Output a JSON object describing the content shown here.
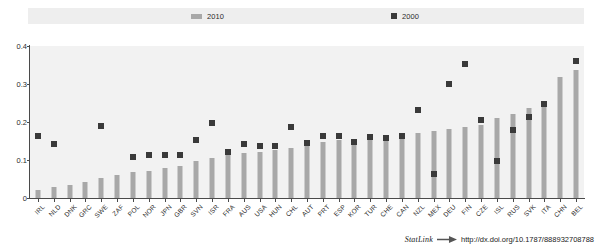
{
  "legend": {
    "items": [
      {
        "label": "2010",
        "type": "bar",
        "color": "#a8a8a8"
      },
      {
        "label": "2000",
        "type": "marker",
        "color": "#3a3a3a"
      }
    ]
  },
  "footer": {
    "statlink_label": "StatLink",
    "statlink_icon": "arrow-glyph-icon",
    "url": "http://dx.doi.org/10.1787/888932708788"
  },
  "chart_data": {
    "type": "bar",
    "title": "",
    "subtitle": "",
    "xlabel": "",
    "ylabel": "",
    "ylim": [
      0,
      0.4
    ],
    "yticks": [
      0,
      0.1,
      0.2,
      0.3,
      0.4
    ],
    "ytick_labels": [
      "0",
      "0.1",
      "0.2",
      "0.3",
      "0.4"
    ],
    "grid": false,
    "legend_position": "top",
    "categories": [
      "IRL",
      "NLD",
      "DNK",
      "GRC",
      "SWE",
      "ZAF",
      "POL",
      "NOR",
      "JPN",
      "GBR",
      "SVN",
      "ISR",
      "FRA",
      "AUS",
      "USA",
      "HUN",
      "CHL",
      "AUT",
      "PRT",
      "ESP",
      "KOR",
      "TUR",
      "CHE",
      "CAN",
      "NZL",
      "MEX",
      "DEU",
      "FIN",
      "CZE",
      "ISL",
      "RUS",
      "SVK",
      "ITA",
      "CHN",
      "BEL"
    ],
    "series": [
      {
        "name": "2010",
        "type": "bar",
        "color": "#a8a8a8",
        "values": [
          0.022,
          0.028,
          0.033,
          0.043,
          0.052,
          0.06,
          0.068,
          0.072,
          0.078,
          0.085,
          0.098,
          0.104,
          0.112,
          0.118,
          0.122,
          0.126,
          0.132,
          0.14,
          0.148,
          0.152,
          0.155,
          0.158,
          0.162,
          0.168,
          0.172,
          0.176,
          0.182,
          0.188,
          0.192,
          0.21,
          0.222,
          0.238,
          0.252,
          0.318,
          0.338
        ]
      },
      {
        "name": "2000",
        "type": "marker",
        "color": "#3a3a3a",
        "values": [
          0.162,
          0.142,
          null,
          null,
          0.19,
          null,
          0.108,
          0.112,
          0.112,
          0.113,
          0.152,
          0.198,
          0.12,
          0.142,
          0.138,
          0.136,
          0.188,
          0.145,
          0.162,
          0.163,
          0.147,
          0.16,
          0.158,
          0.162,
          0.232,
          0.062,
          0.3,
          0.352,
          0.205,
          0.098,
          0.178,
          0.212,
          0.248,
          null,
          0.36
        ]
      }
    ]
  }
}
